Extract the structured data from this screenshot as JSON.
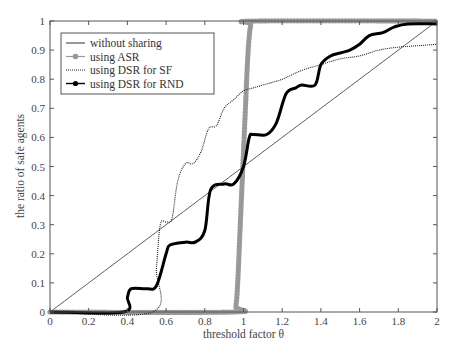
{
  "chart_data": {
    "type": "line",
    "title": "",
    "xlabel": "threshold factor θ",
    "ylabel": "the ratio of safe agents",
    "xlim": [
      0,
      2
    ],
    "ylim": [
      0,
      1
    ],
    "xticks": [
      "0",
      "0.2",
      "0.4",
      "0.6",
      "0.8",
      "1",
      "1.2",
      "1.4",
      "1.6",
      "1.8",
      "2"
    ],
    "yticks": [
      "0",
      "0.1",
      "0.2",
      "0.3",
      "0.4",
      "0.5",
      "0.6",
      "0.7",
      "0.8",
      "0.9",
      "1"
    ],
    "grid": false,
    "legend_position": "upper left",
    "series": [
      {
        "name": "without sharing",
        "style": "thin solid",
        "color": "#333333",
        "x": [
          0,
          2
        ],
        "y": [
          0,
          1
        ]
      },
      {
        "name": "using ASR",
        "style": "gray dots",
        "color": "#999999",
        "x": [
          0,
          0.94,
          0.96,
          0.97,
          0.98,
          0.99,
          1.0,
          1.01,
          1.02,
          1.03,
          1.04,
          1.06,
          2.0
        ],
        "y": [
          0,
          0,
          0.02,
          0.1,
          0.25,
          0.4,
          0.55,
          0.7,
          0.85,
          0.95,
          0.99,
          1.0,
          1.0
        ]
      },
      {
        "name": "using DSR for SF",
        "style": "thin dotted",
        "color": "#222222",
        "x": [
          0,
          0.53,
          0.55,
          0.57,
          0.6,
          0.63,
          0.66,
          0.7,
          0.74,
          0.78,
          0.82,
          0.86,
          0.9,
          0.95,
          1.0,
          1.05,
          1.1,
          1.2,
          1.3,
          1.4,
          1.5,
          1.6,
          1.7,
          1.8,
          1.9,
          2.0
        ],
        "y": [
          0,
          0.0,
          0.15,
          0.3,
          0.31,
          0.32,
          0.45,
          0.51,
          0.51,
          0.55,
          0.63,
          0.64,
          0.7,
          0.73,
          0.76,
          0.77,
          0.78,
          0.8,
          0.83,
          0.85,
          0.87,
          0.88,
          0.9,
          0.91,
          0.915,
          0.92
        ]
      },
      {
        "name": "using DSR for RND",
        "style": "thick solid",
        "color": "#000000",
        "x": [
          0,
          0.38,
          0.4,
          0.42,
          0.5,
          0.55,
          0.6,
          0.62,
          0.7,
          0.75,
          0.8,
          0.83,
          0.9,
          0.95,
          1.0,
          1.03,
          1.05,
          1.12,
          1.17,
          1.22,
          1.27,
          1.3,
          1.37,
          1.4,
          1.45,
          1.5,
          1.55,
          1.6,
          1.65,
          1.72,
          1.78,
          1.85,
          2.0
        ],
        "y": [
          0,
          0,
          0.05,
          0.08,
          0.08,
          0.09,
          0.2,
          0.23,
          0.24,
          0.24,
          0.28,
          0.42,
          0.44,
          0.44,
          0.5,
          0.6,
          0.61,
          0.61,
          0.65,
          0.75,
          0.77,
          0.78,
          0.78,
          0.85,
          0.88,
          0.89,
          0.9,
          0.92,
          0.95,
          0.96,
          0.98,
          0.99,
          0.99
        ]
      }
    ]
  }
}
